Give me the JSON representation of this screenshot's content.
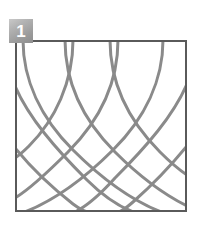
{
  "figure": {
    "badge_label": "1",
    "badge_color": "#a8a8a8",
    "badge_text_color": "#ffffff",
    "background_color": "#ffffff",
    "caption": ""
  },
  "frame": {
    "x": 15,
    "y": 40,
    "width": 172,
    "height": 172,
    "border_color": "#5a5a5a",
    "border_width": 2,
    "fill_color": "#ffffff"
  },
  "pattern": {
    "type": "curved-lattice",
    "stroke_color": "#8a8a8a",
    "stroke_width": 3,
    "family_a_label": "arcs curving down-right",
    "family_b_label": "arcs curving down-left",
    "curve_count_a": 5,
    "curve_count_b": 5,
    "viewbox": "0 0 172 172",
    "family_a": [
      "M 8 0 C 8 40, 26 78, 58 110 C 86 138, 116 160, 146 172",
      "M 50 0 C 50 42, 68 80, 100 112 C 126 138, 152 156, 172 166",
      "M 95 0 C 95 42, 113 80, 145 112 C 158 125, 166 131, 172 135",
      "M 0 46 C 14 78, 40 108, 72 140 C 92 160, 108 168, 118 172",
      "M 0 108 C 18 130, 40 150, 58 164 C 66 170, 70 172, 74 172"
    ],
    "family_b": [
      "M 148 0 C 148 40, 130 78, 98 110 C 70 138, 40 160, 10 172",
      "M 103 0 C 103 42, 85 80, 53 112 C 30 135, 10 152, 0 158",
      "M 58 0 C 58 42, 40 80, 14 106 C 8 112, 3 116, 0 118",
      "M 172 44 C 158 76, 132 106, 100 138 C 82 158, 68 168, 60 172",
      "M 172 106 C 154 128, 134 148, 118 162 C 110 169, 106 172, 103 172"
    ]
  }
}
